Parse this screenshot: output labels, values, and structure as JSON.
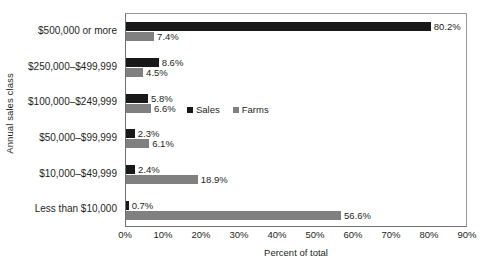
{
  "chart_data": {
    "type": "bar",
    "orientation": "horizontal",
    "title": "",
    "xlabel": "Percent of total",
    "ylabel": "Annual sales class",
    "xlim": [
      0,
      90
    ],
    "xticks": [
      0,
      10,
      20,
      30,
      40,
      50,
      60,
      70,
      80,
      90
    ],
    "xtick_labels": [
      "0%",
      "10%",
      "20%",
      "30%",
      "40%",
      "50%",
      "60%",
      "70%",
      "80%",
      "90%"
    ],
    "grid": false,
    "legend_position": "inside-right",
    "categories": [
      "$500,000 or more",
      "$250,000–$499,999",
      "$100,000–$249,999",
      "$50,000–$99,999",
      "$10,000–$49,999",
      "Less than $10,000"
    ],
    "series": [
      {
        "name": "Sales",
        "color": "#181818",
        "values": [
          80.2,
          8.6,
          5.8,
          2.3,
          2.4,
          0.7
        ],
        "labels": [
          "80.2%",
          "8.6%",
          "5.8%",
          "2.3%",
          "2.4%",
          "0.7%"
        ]
      },
      {
        "name": "Farms",
        "color": "#808080",
        "values": [
          7.4,
          4.5,
          6.6,
          6.1,
          18.9,
          56.6
        ],
        "labels": [
          "7.4%",
          "4.5%",
          "6.6%",
          "6.1%",
          "18.9%",
          "56.6%"
        ]
      }
    ]
  },
  "legend": {
    "entries": [
      {
        "label": "Sales"
      },
      {
        "label": "Farms"
      }
    ]
  },
  "axes": {
    "x_title": "Percent of total",
    "y_title": "Annual sales class"
  }
}
